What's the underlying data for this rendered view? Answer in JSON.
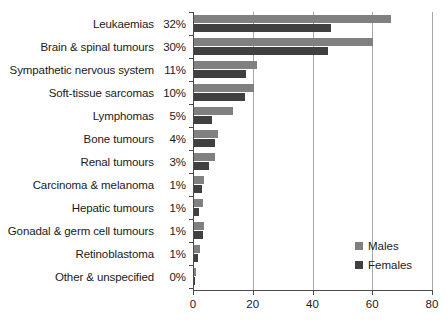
{
  "chart_data": {
    "type": "bar",
    "orientation": "horizontal",
    "title": "",
    "subtitle": "",
    "xlabel": "",
    "ylabel": "",
    "xlim": [
      0,
      80
    ],
    "xticks": [
      0,
      20,
      40,
      60,
      80
    ],
    "xtick_labels": [
      "0",
      "20",
      "40",
      "60",
      "80"
    ],
    "grid": "vertical",
    "legend_position": "right-lower",
    "categories": [
      "Leukaemias",
      "Brain & spinal tumours",
      "Sympathetic nervous system",
      "Soft-tissue sarcomas",
      "Lymphomas",
      "Bone tumours",
      "Renal tumours",
      "Carcinoma & melanoma",
      "Hepatic tumours",
      "Gonadal & germ cell tumours",
      "Retinoblastoma",
      "Other & unspecified"
    ],
    "category_percents": [
      "32%",
      "30%",
      "11%",
      "10%",
      "5%",
      "4%",
      "3%",
      "1%",
      "1%",
      "1%",
      "1%",
      "0%"
    ],
    "series": [
      {
        "name": "Males",
        "color": "#808080",
        "values": [
          66,
          60,
          21,
          20,
          13,
          8,
          7,
          3.2,
          3.0,
          3.2,
          2.0,
          0.6
        ]
      },
      {
        "name": "Females",
        "color": "#404040",
        "values": [
          46,
          45,
          17.5,
          17,
          6,
          7,
          5,
          2.6,
          1.6,
          3.0,
          1.2,
          0.4
        ]
      }
    ]
  },
  "legend": {
    "items": [
      {
        "label": "Males",
        "color": "#808080"
      },
      {
        "label": "Females",
        "color": "#404040"
      }
    ]
  },
  "axis": {
    "tick_labels": [
      "0",
      "20",
      "40",
      "60",
      "80"
    ]
  }
}
